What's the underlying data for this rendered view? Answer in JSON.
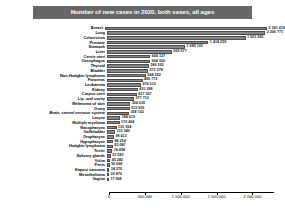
{
  "chart_data": {
    "type": "bar",
    "orientation": "horizontal",
    "title": "Number of new cases in 2020, both sexes, all ages",
    "xlabel": "",
    "ylabel": "",
    "xlim": [
      0,
      2300000
    ],
    "grid": false,
    "legend": null,
    "axis_ticks": [
      "0",
      "500 000",
      "1 000 000",
      "1 500 000",
      "2 000 000"
    ],
    "axis_tick_values": [
      0,
      500000,
      1000000,
      1500000,
      2000000
    ],
    "bar_color": "#878789",
    "title_bar_color": "#666769",
    "title_text_color": "#ffffff",
    "categories": [
      "Breast",
      "Lung",
      "Colorectum",
      "Prostate",
      "Stomach",
      "Liver",
      "Cervix uteri",
      "Oesophagus",
      "Thyroid",
      "Bladder",
      "Non-Hodgkin lymphoma",
      "Pancreas",
      "Leukaemia",
      "Kidney",
      "Corpus uteri",
      "Lip, oral cavity",
      "Melanoma of skin",
      "Ovary",
      "Brain, central nervous system",
      "Larynx",
      "Multiple myeloma",
      "Nasopharynx",
      "Gallbladder",
      "Oropharynx",
      "Hypopharynx",
      "Hodgkin lymphoma",
      "Testis",
      "Salivary glands",
      "Vulva",
      "Penis",
      "Kaposi sarcoma",
      "Mesothelioma",
      "Vagina"
    ],
    "values": [
      2261419,
      2206771,
      1931590,
      1414259,
      1089103,
      905677,
      604127,
      604100,
      586202,
      573278,
      544352,
      495773,
      474519,
      431288,
      417367,
      377713,
      324635,
      313959,
      308102,
      184615,
      176404,
      133354,
      115949,
      98412,
      84254,
      83087,
      74458,
      53583,
      45240,
      36068,
      34270,
      30870,
      17908
    ],
    "value_labels": [
      "2 261 419",
      "2 206 771",
      "1 931 590",
      "1 414 259",
      "1 089 103",
      "905 677",
      "604 127",
      "604 100",
      "586 202",
      "573 278",
      "544 352",
      "495 773",
      "474 519",
      "431 288",
      "417 367",
      "377 713",
      "324 635",
      "313 959",
      "308 102",
      "184 615",
      "176 404",
      "133 354",
      "115 949",
      "98 412",
      "84 254",
      "83 087",
      "74 458",
      "53 583",
      "45 240",
      "36 068",
      "34 270",
      "30 870",
      "17 908"
    ]
  }
}
